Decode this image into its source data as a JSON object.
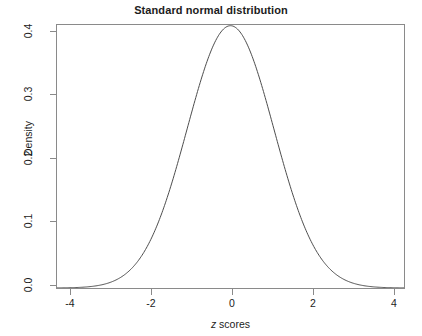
{
  "chart_data": {
    "type": "line",
    "title": "Standard normal distribution",
    "xlabel_parts": {
      "italic": "z",
      "rest": " scores"
    },
    "xlabel": "z scores",
    "ylabel": "Density",
    "xlim": [
      -4,
      4
    ],
    "ylim": [
      0.0,
      0.4
    ],
    "grid": false,
    "legend": null,
    "line_color": "#4d4d4d",
    "axis_color": "#8a8a8a",
    "xticks": [
      -4,
      -2,
      0,
      2,
      4
    ],
    "xticklabels": [
      "-4",
      "-2",
      "0",
      "2",
      "4"
    ],
    "yticks": [
      0.0,
      0.1,
      0.2,
      0.3,
      0.4
    ],
    "yticklabels": [
      "0.0",
      "0.1",
      "0.2",
      "0.3",
      "0.4"
    ],
    "series": [
      {
        "name": "Standard normal density",
        "distribution": "normal",
        "mean": 0,
        "sd": 1,
        "x": [
          -4.0,
          -3.8,
          -3.6,
          -3.4,
          -3.2,
          -3.0,
          -2.8,
          -2.6,
          -2.4,
          -2.2,
          -2.0,
          -1.8,
          -1.6,
          -1.4,
          -1.2,
          -1.0,
          -0.8,
          -0.6,
          -0.4,
          -0.2,
          0.0,
          0.2,
          0.4,
          0.6,
          0.8,
          1.0,
          1.2,
          1.4,
          1.6,
          1.8,
          2.0,
          2.2,
          2.4,
          2.6,
          2.8,
          3.0,
          3.2,
          3.4,
          3.6,
          3.8,
          4.0
        ],
        "values": [
          0.0001,
          0.0003,
          0.0006,
          0.0012,
          0.0024,
          0.0044,
          0.0079,
          0.0136,
          0.0224,
          0.0355,
          0.054,
          0.079,
          0.1109,
          0.1497,
          0.1942,
          0.242,
          0.2897,
          0.3332,
          0.3683,
          0.391,
          0.3989,
          0.391,
          0.3683,
          0.3332,
          0.2897,
          0.242,
          0.1942,
          0.1497,
          0.1109,
          0.079,
          0.054,
          0.0355,
          0.0224,
          0.0136,
          0.0079,
          0.0044,
          0.0024,
          0.0012,
          0.0006,
          0.0003,
          0.0001
        ]
      }
    ],
    "peak": {
      "x": 0,
      "y": 0.3989
    }
  }
}
